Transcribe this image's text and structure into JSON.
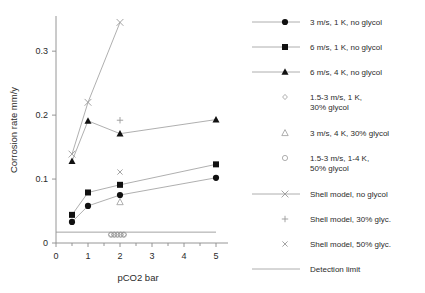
{
  "chart_data": {
    "type": "scatter",
    "title": "",
    "xlabel": "pCO2  bar",
    "ylabel": "Corrosion rate  mm/y",
    "xticks": [
      "0",
      "1",
      "2",
      "3",
      "4",
      "5"
    ],
    "yticks": [
      "0",
      "0.1",
      "0.2",
      "0.3"
    ],
    "xlim": [
      0,
      5
    ],
    "ylim": [
      0,
      0.355
    ],
    "grid": false,
    "legend_position": "right",
    "series": [
      {
        "name": "3 m/s, 1 K, no glycol",
        "marker": "filled-circle",
        "line": true,
        "x": [
          0.5,
          1,
          2,
          5
        ],
        "values": [
          0.033,
          0.058,
          0.075,
          0.102
        ]
      },
      {
        "name": "6 m/s, 1 K, no glycol",
        "marker": "filled-square",
        "line": true,
        "x": [
          0.5,
          1,
          2,
          5
        ],
        "values": [
          0.044,
          0.079,
          0.091,
          0.123
        ]
      },
      {
        "name": "6 m/s, 4 K, no glycol",
        "marker": "filled-triangle",
        "line": true,
        "x": [
          0.5,
          1,
          2,
          5
        ],
        "values": [
          0.128,
          0.191,
          0.171,
          0.193
        ]
      },
      {
        "name": "1.5-3 m/s, 1 K, 30% glycol",
        "marker": "open-diamond",
        "line": false,
        "x": [
          1.72,
          1.82,
          1.92,
          2.02,
          2.12
        ],
        "values": [
          0.013,
          0.013,
          0.013,
          0.013,
          0.013
        ]
      },
      {
        "name": "3 m/s, 4 K, 30% glycol",
        "marker": "open-triangle",
        "line": false,
        "x": [
          2
        ],
        "values": [
          0.064
        ]
      },
      {
        "name": "1.5-3 m/s, 1-4 K, 50% glycol",
        "marker": "open-circle",
        "line": false,
        "x": [
          1.72,
          1.82,
          1.92,
          2.02,
          2.12
        ],
        "values": [
          0.013,
          0.013,
          0.013,
          0.013,
          0.013
        ]
      },
      {
        "name": "Shell model, no glycol",
        "marker": "cross-x",
        "line": true,
        "x": [
          0.5,
          1,
          2
        ],
        "values": [
          0.139,
          0.22,
          0.345
        ]
      },
      {
        "name": "Shell model, 30% glyc.",
        "marker": "plus",
        "line": false,
        "x": [
          2
        ],
        "values": [
          0.192
        ]
      },
      {
        "name": "Shell model, 50% glyc.",
        "marker": "small-x",
        "line": false,
        "x": [
          2
        ],
        "values": [
          0.111
        ]
      },
      {
        "name": "Detection limit",
        "marker": "line",
        "line": true,
        "x": [
          0,
          5
        ],
        "values": [
          0.017,
          0.017
        ]
      }
    ]
  },
  "legend": {
    "items": [
      {
        "label": "3 m/s, 1 K, no glycol",
        "marker": "filled-circle",
        "with_line": true
      },
      {
        "label": "6 m/s, 1 K, no glycol",
        "marker": "filled-square",
        "with_line": true
      },
      {
        "label": "6 m/s, 4 K, no glycol",
        "marker": "filled-triangle",
        "with_line": true
      },
      {
        "label": "1.5-3 m/s, 1 K,",
        "label2": "30% glycol",
        "marker": "open-diamond",
        "with_line": false
      },
      {
        "label": "3 m/s, 4 K, 30% glycol",
        "marker": "open-triangle",
        "with_line": false
      },
      {
        "label": "1.5-3 m/s, 1-4 K,",
        "label2": "50% glycol",
        "marker": "open-circle",
        "with_line": false
      },
      {
        "label": "Shell model, no glycol",
        "marker": "cross-x",
        "with_line": true
      },
      {
        "label": "Shell model, 30% glyc.",
        "marker": "plus",
        "with_line": false
      },
      {
        "label": "Shell model, 50% glyc.",
        "marker": "small-x",
        "with_line": false
      },
      {
        "label": "Detection limit",
        "marker": "line",
        "with_line": true
      }
    ]
  },
  "colors": {
    "axis": "#8a8a8a",
    "line": "#9a9a9a",
    "marker_fill": "#111111",
    "text": "#2b2b2b",
    "background": "#ffffff"
  }
}
